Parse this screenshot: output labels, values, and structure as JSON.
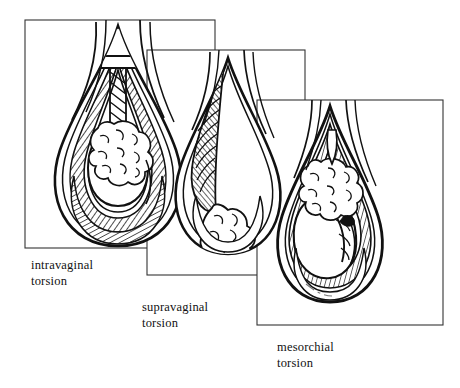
{
  "figure": {
    "background_color": "#ffffff",
    "ink_color": "#111111",
    "style": "black-and-white pen-and-ink line drawing with hatching",
    "panel_count": 3
  },
  "panels": [
    {
      "id": "intravaginal",
      "caption": "intravaginal\ntorsion",
      "frame": {
        "x": 25,
        "y": 20,
        "width": 190,
        "height": 228
      },
      "depicts": "cut-away scrotum showing spermatic cord twisted inside the tunica vaginalis, with epididymis and testis"
    },
    {
      "id": "supravaginal",
      "caption": "supravaginal\ntorsion",
      "frame": {
        "x": 147,
        "y": 50,
        "width": 158,
        "height": 225
      },
      "depicts": "cut-away scrotum showing the cord twisted above the tunica vaginalis"
    },
    {
      "id": "mesorchial",
      "caption": "mesorchial\ntorsion",
      "frame": {
        "x": 257,
        "y": 100,
        "width": 186,
        "height": 225
      },
      "depicts": "cut-away scrotum showing torsion of the mesorchium between testis and epididymis"
    }
  ]
}
